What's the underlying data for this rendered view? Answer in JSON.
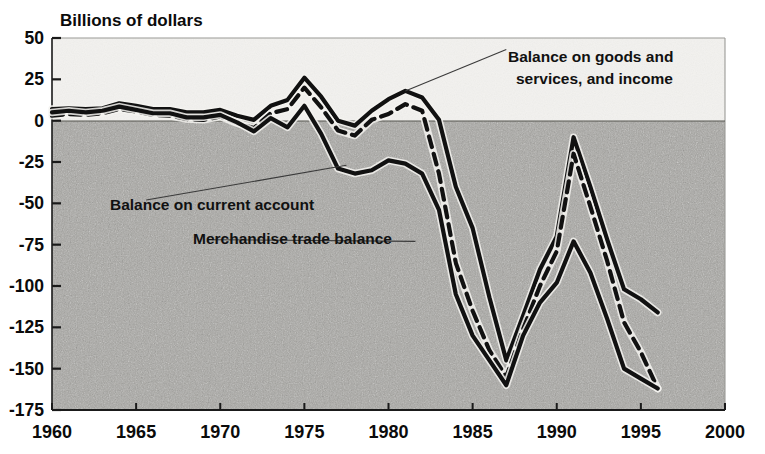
{
  "figure": {
    "title": "Billions of dollars",
    "background_upper": "#f2f1ee",
    "background_lower": "#a9a8a4",
    "ink_color": "#111111"
  },
  "chart_data": {
    "type": "line",
    "title": "Billions of dollars",
    "xlabel": "",
    "ylabel": "Billions of dollars",
    "xlim": [
      1960,
      2000
    ],
    "ylim": [
      -175,
      50
    ],
    "grid": false,
    "legend": "annotations",
    "xticks": [
      1960,
      1965,
      1970,
      1975,
      1980,
      1985,
      1990,
      1995,
      2000
    ],
    "yticks": [
      50,
      25,
      0,
      -25,
      -50,
      -75,
      -100,
      -125,
      -150,
      -175
    ],
    "annotations": [
      {
        "text": "Balance on goods and services, and income",
        "lines": [
          "Balance on goods and",
          "services, and income"
        ],
        "series": "Balance on goods and services, and income",
        "label_x": 1987.0,
        "label_y": 43.0,
        "point_x": 1981.0,
        "point_y": 18.0
      },
      {
        "text": "Balance on current account",
        "series": "Balance on current account",
        "label_x": 1965.6,
        "label_y": -48.0,
        "point_x": 1977.5,
        "point_y": -27.0
      },
      {
        "text": "Merchandise trade balance",
        "series": "Merchandise trade balance",
        "label_x": 1969.5,
        "label_y": -72.0,
        "point_x": 1981.6,
        "point_y": -73.0
      }
    ],
    "series": [
      {
        "name": "Balance on goods and services, and income",
        "style": "solid",
        "x": [
          1960,
          1961,
          1962,
          1963,
          1964,
          1965,
          1966,
          1967,
          1968,
          1969,
          1970,
          1971,
          1972,
          1973,
          1974,
          1975,
          1976,
          1977,
          1978,
          1979,
          1980,
          1981,
          1982,
          1983,
          1984,
          1985,
          1986,
          1987,
          1988,
          1989,
          1990,
          1991,
          1992,
          1993,
          1994,
          1995,
          1996
        ],
        "y": [
          7.0,
          7.5,
          7.0,
          7.5,
          10.5,
          9.0,
          7.0,
          7.0,
          5.0,
          5.0,
          6.5,
          3.0,
          0.5,
          9.0,
          12.5,
          26.0,
          14.5,
          0.0,
          -3.0,
          6.0,
          13.0,
          18.0,
          14.0,
          0.5,
          -40.0,
          -65.0,
          -107.0,
          -145.0,
          -118.0,
          -90.0,
          -70.0,
          -10.0,
          -40.0,
          -72.0,
          -102.0,
          -108.0,
          -116.0
        ]
      },
      {
        "name": "Balance on current account",
        "style": "dashed",
        "x": [
          1960,
          1961,
          1962,
          1963,
          1964,
          1965,
          1966,
          1967,
          1968,
          1969,
          1970,
          1971,
          1972,
          1973,
          1974,
          1975,
          1976,
          1977,
          1978,
          1979,
          1980,
          1981,
          1982,
          1983,
          1984,
          1985,
          1986,
          1987,
          1988,
          1989,
          1990,
          1991,
          1992,
          1993,
          1994,
          1995,
          1996
        ],
        "y": [
          3.0,
          4.0,
          3.5,
          4.5,
          7.0,
          5.5,
          3.5,
          3.0,
          1.0,
          0.5,
          2.5,
          -1.5,
          -4.5,
          4.5,
          7.0,
          20.0,
          8.0,
          -6.0,
          -9.0,
          0.5,
          4.0,
          10.0,
          6.0,
          -32.0,
          -86.0,
          -115.0,
          -139.0,
          -155.0,
          -126.0,
          -100.0,
          -79.0,
          -20.0,
          -52.0,
          -85.0,
          -122.0,
          -140.0,
          -162.0
        ]
      },
      {
        "name": "Merchandise trade balance",
        "style": "solid",
        "x": [
          1960,
          1961,
          1962,
          1963,
          1964,
          1965,
          1966,
          1967,
          1968,
          1969,
          1970,
          1971,
          1972,
          1973,
          1974,
          1975,
          1976,
          1977,
          1978,
          1979,
          1980,
          1981,
          1982,
          1983,
          1984,
          1985,
          1986,
          1987,
          1988,
          1989,
          1990,
          1991,
          1992,
          1993,
          1994,
          1995,
          1996
        ],
        "y": [
          5.0,
          6.0,
          5.0,
          6.0,
          8.5,
          6.5,
          4.5,
          4.5,
          2.0,
          2.0,
          3.5,
          -1.0,
          -6.5,
          1.5,
          -4.0,
          9.0,
          -8.0,
          -29.0,
          -32.0,
          -30.0,
          -24.0,
          -26.0,
          -32.0,
          -54.0,
          -105.0,
          -130.0,
          -145.0,
          -160.0,
          -130.0,
          -110.0,
          -98.0,
          -73.0,
          -92.0,
          -120.0,
          -150.0,
          -156.0,
          -162.0
        ]
      }
    ]
  }
}
